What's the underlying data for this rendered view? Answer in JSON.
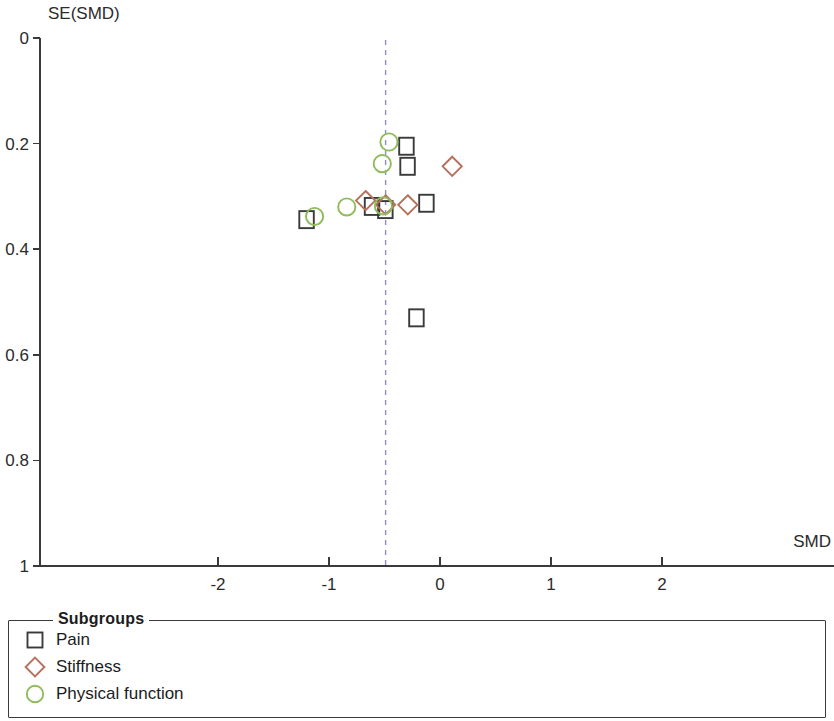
{
  "chart_data": {
    "type": "scatter",
    "title": "",
    "subtitle": "",
    "xlabel": "SMD",
    "ylabel": "SE(SMD)",
    "xlim": [
      -2.85,
      3.55
    ],
    "ylim": [
      0,
      1
    ],
    "y_axis_inverted": true,
    "grid": false,
    "legend_position": "bottom",
    "legend_title": "Subgroups",
    "xticks": [
      -2,
      -1,
      0,
      1,
      2
    ],
    "xtick_labels": [
      "-2",
      "-1",
      "0",
      "1",
      "2"
    ],
    "yticks": [
      0,
      0.2,
      0.4,
      0.6,
      0.8,
      1
    ],
    "ytick_labels": [
      "0",
      "0.2",
      "0.4",
      "0.6",
      "0.8",
      "1"
    ],
    "reference_line": {
      "type": "vertical-dashed",
      "x": -0.49,
      "color": "#8b8fc4"
    },
    "series": [
      {
        "name": "Pain",
        "marker": "square",
        "color": "#3a3a3a",
        "points": [
          {
            "x": -0.3,
            "y": 0.205
          },
          {
            "x": -0.29,
            "y": 0.243
          },
          {
            "x": -0.61,
            "y": 0.319
          },
          {
            "x": -0.49,
            "y": 0.325
          },
          {
            "x": -0.12,
            "y": 0.313
          },
          {
            "x": -1.2,
            "y": 0.344
          },
          {
            "x": -0.21,
            "y": 0.53
          }
        ]
      },
      {
        "name": "Stiffness",
        "marker": "diamond",
        "color": "#b5705a",
        "points": [
          {
            "x": 0.11,
            "y": 0.243
          },
          {
            "x": -0.67,
            "y": 0.308
          },
          {
            "x": -0.49,
            "y": 0.316
          },
          {
            "x": -0.29,
            "y": 0.316
          }
        ]
      },
      {
        "name": "Physical function",
        "marker": "circle",
        "color": "#8fbc5a",
        "points": [
          {
            "x": -0.46,
            "y": 0.197
          },
          {
            "x": -0.52,
            "y": 0.238
          },
          {
            "x": -0.84,
            "y": 0.32
          },
          {
            "x": -0.51,
            "y": 0.318
          },
          {
            "x": -1.13,
            "y": 0.338
          }
        ]
      }
    ]
  },
  "axes": {
    "y_title": "SE(SMD)",
    "x_title": "SMD"
  },
  "legend": {
    "title": "Subgroups",
    "items": [
      {
        "label": "Pain",
        "marker": "square",
        "color": "#3a3a3a",
        "icon": "square-marker-icon"
      },
      {
        "label": "Stiffness",
        "marker": "diamond",
        "color": "#b5705a",
        "icon": "diamond-marker-icon"
      },
      {
        "label": "Physical function",
        "marker": "circle",
        "color": "#8fbc5a",
        "icon": "circle-marker-icon"
      }
    ]
  }
}
